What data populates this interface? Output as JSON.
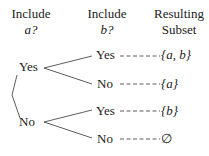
{
  "headers": [
    {
      "line1": "Include",
      "line2": "a?"
    },
    {
      "line1": "Include",
      "line2": "b?"
    },
    {
      "line1": "Resulting",
      "line2": "Subset"
    }
  ],
  "level1": [
    {
      "label": "Yes"
    },
    {
      "label": "No"
    }
  ],
  "level2": [
    {
      "label": "Yes",
      "subset": "{a, b}"
    },
    {
      "label": "No",
      "subset": "{a}"
    },
    {
      "label": "Yes",
      "subset": "{b}"
    },
    {
      "label": "No",
      "subset": "∅"
    }
  ]
}
